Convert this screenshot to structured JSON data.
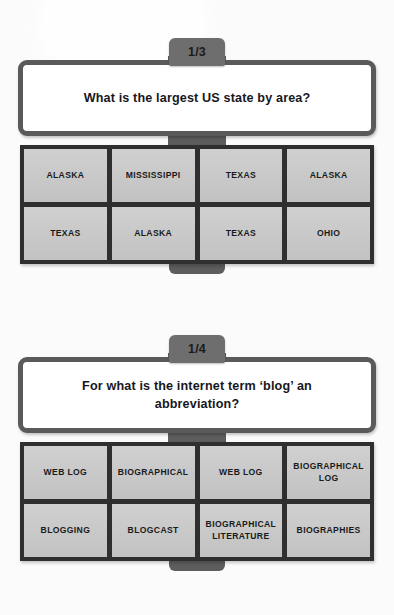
{
  "background": {
    "page_color": "#fbfbfb",
    "card_border_color": "#5a5a5a",
    "grid_background_color": "#2f2f2f",
    "answer_cell_color": "#c6c6c6",
    "counter_tab_color": "#6e6e6e"
  },
  "cards": [
    {
      "counter": "1/3",
      "question": "What is the largest US state by area?",
      "answers": [
        "ALASKA",
        "MISSISSIPPI",
        "TEXAS",
        "ALASKA",
        "TEXAS",
        "ALASKA",
        "TEXAS",
        "OHIO"
      ]
    },
    {
      "counter": "1/4",
      "question": "For what is the internet term ‘blog’ an abbreviation?",
      "answers": [
        "WEB LOG",
        "BIOGRAPHICAL",
        "WEB LOG",
        "BIOGRAPHICAL LOG",
        "BLOGGING",
        "BLOGCAST",
        "BIOGRAPHICAL LITERATURE",
        "BIOGRAPHIES"
      ]
    }
  ]
}
